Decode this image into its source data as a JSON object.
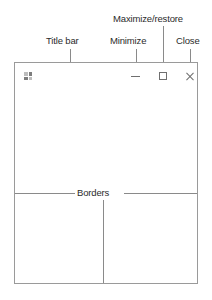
{
  "figure": {
    "type": "annotated-window-diagram",
    "background_color": "#ffffff",
    "line_color": "#8a8a8a",
    "text_color": "#2b2b2b"
  },
  "callouts": [
    {
      "id": "title-bar",
      "label": "Title bar"
    },
    {
      "id": "minimize",
      "label": "Minimize"
    },
    {
      "id": "maximize-restore",
      "label": "Maximize/restore"
    },
    {
      "id": "close",
      "label": "Close"
    },
    {
      "id": "borders",
      "label": "Borders"
    }
  ],
  "window": {
    "icon": "app-grid-icon",
    "controls": [
      {
        "name": "minimize-button",
        "glyph": "minimize-dash-icon"
      },
      {
        "name": "maximize-restore-button",
        "glyph": "maximize-square-icon"
      },
      {
        "name": "close-button",
        "glyph": "close-x-icon"
      }
    ],
    "border_color": "#9a9a9a",
    "client_area_color": "#ffffff"
  }
}
